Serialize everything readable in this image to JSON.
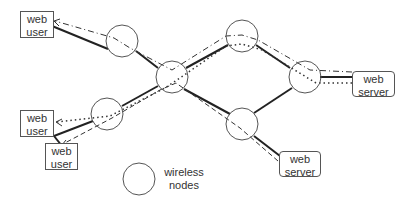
{
  "diagram": {
    "type": "wireless mesh network",
    "boxes": [
      {
        "id": "user1",
        "line1": "web",
        "line2": "user",
        "kind": "web-user"
      },
      {
        "id": "user2",
        "line1": "web",
        "line2": "user",
        "kind": "web-user"
      },
      {
        "id": "user3",
        "line1": "web",
        "line2": "user",
        "kind": "web-user"
      },
      {
        "id": "server1",
        "line1": "web",
        "line2": "server",
        "kind": "web-server"
      },
      {
        "id": "server2",
        "line1": "web",
        "line2": "server",
        "kind": "web-server"
      }
    ],
    "nodes": [
      "A",
      "B",
      "C",
      "D",
      "E",
      "F"
    ],
    "links": [
      [
        "user1",
        "A"
      ],
      [
        "A",
        "B"
      ],
      [
        "B",
        "C"
      ],
      [
        "C",
        "D"
      ],
      [
        "D",
        "server1"
      ],
      [
        "B",
        "E"
      ],
      [
        "E",
        "D"
      ],
      [
        "E",
        "server2"
      ],
      [
        "B",
        "F"
      ],
      [
        "F",
        "user2"
      ],
      [
        "user2",
        "user3"
      ]
    ],
    "flows": [
      {
        "style": "dash-dot",
        "path": [
          "server1",
          "D",
          "C",
          "B",
          "A",
          "user1"
        ]
      },
      {
        "style": "dotted",
        "path": [
          "server1",
          "D",
          "C",
          "B",
          "F",
          "user2"
        ]
      },
      {
        "style": "dashed",
        "path": [
          "server2",
          "E",
          "B",
          "F",
          "user3"
        ]
      }
    ],
    "legend": {
      "line1": "wireless",
      "line2": "nodes"
    },
    "colors": {
      "line": "#222222",
      "node": "#555555",
      "text": "#333333"
    }
  }
}
